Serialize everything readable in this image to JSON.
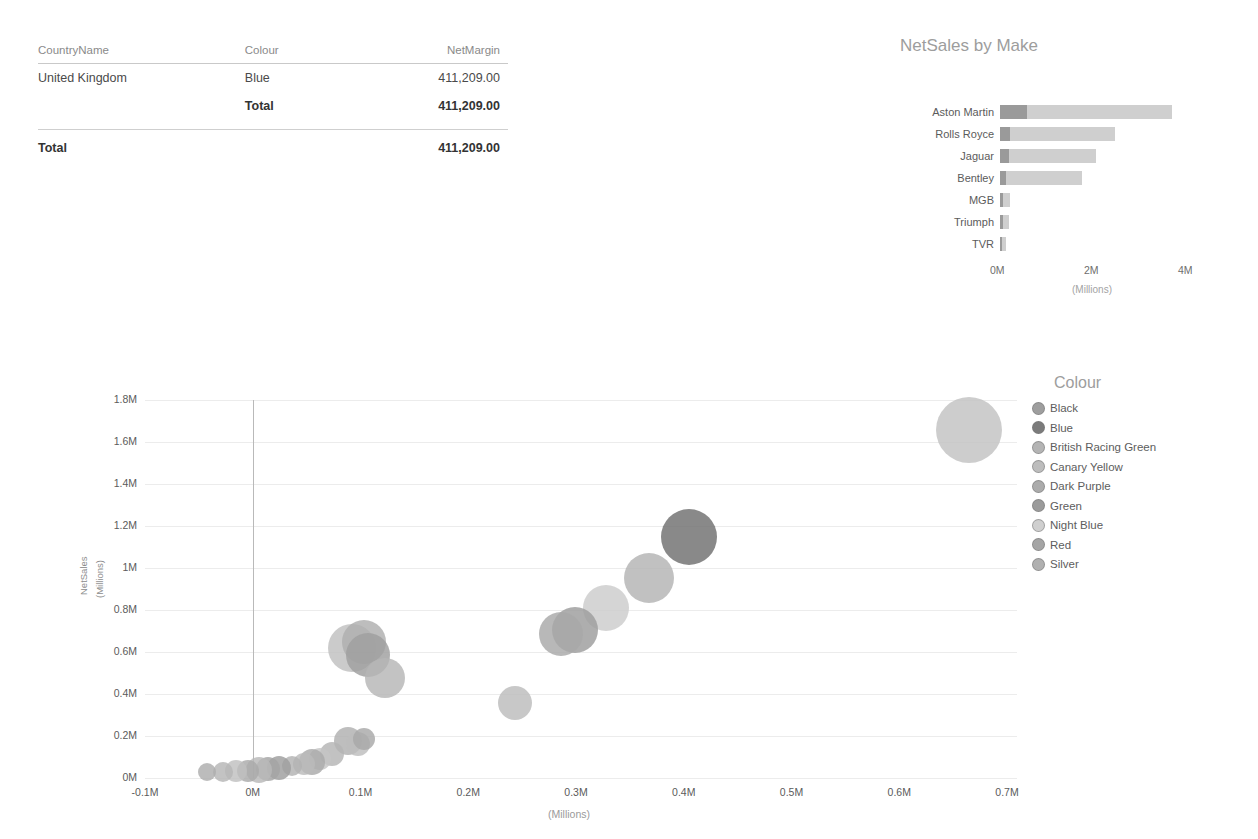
{
  "matrix": {
    "columns": [
      "CountryName",
      "Colour",
      "NetMargin"
    ],
    "rows": [
      {
        "country": "United Kingdom",
        "colour": "Blue",
        "netmargin": "411,209.00",
        "bold": false
      },
      {
        "country": "",
        "colour": "Total",
        "netmargin": "411,209.00",
        "bold": true
      }
    ],
    "grand_total_label": "Total",
    "grand_total_value": "411,209.00"
  },
  "bar_chart_title": "NetSales by Make",
  "scatter_legend_title": "Colour",
  "chart_data": [
    {
      "type": "bar",
      "title": "NetSales by Make",
      "orientation": "horizontal",
      "stacked": true,
      "xlabel": "(Millions)",
      "ylabel": "",
      "categories": [
        "Aston Martin",
        "Rolls Royce",
        "Jaguar",
        "Bentley",
        "MGB",
        "Triumph",
        "TVR"
      ],
      "values": [
        3.65,
        2.45,
        2.05,
        1.75,
        0.22,
        0.2,
        0.12
      ],
      "series": [
        {
          "name": "dark segment",
          "values": [
            0.58,
            0.22,
            0.2,
            0.13,
            0.07,
            0.06,
            0.05
          ],
          "color": "#9a9a9a"
        },
        {
          "name": "light segment",
          "values": [
            3.07,
            2.23,
            1.85,
            1.62,
            0.15,
            0.14,
            0.07
          ],
          "color": "#cfcfcf"
        }
      ],
      "xticks": [
        "0M",
        "2M",
        "4M"
      ],
      "xlim": [
        0,
        4
      ],
      "grid": false,
      "legend": "none"
    },
    {
      "type": "scatter",
      "subtype": "bubble",
      "title": "",
      "xlabel": "(Millions)",
      "ylabel": "NetSales (Millions)",
      "xticks": [
        "-0.1M",
        "0M",
        "0.1M",
        "0.2M",
        "0.3M",
        "0.4M",
        "0.5M",
        "0.6M",
        "0.7M"
      ],
      "yticks": [
        "0M",
        "0.2M",
        "0.4M",
        "0.6M",
        "0.8M",
        "1M",
        "1.2M",
        "1.4M",
        "1.6M",
        "1.8M"
      ],
      "xlim": [
        -0.1,
        0.7
      ],
      "ylim": [
        0,
        1.8
      ],
      "grid": true,
      "legend_position": "right",
      "legend_title": "Colour",
      "legend_entries": [
        {
          "label": "Black",
          "color": "#9e9e9e"
        },
        {
          "label": "Blue",
          "color": "#7b7b7b"
        },
        {
          "label": "British Racing Green",
          "color": "#b4b4b4"
        },
        {
          "label": "Canary Yellow",
          "color": "#bdbdbd"
        },
        {
          "label": "Dark Purple",
          "color": "#ababab"
        },
        {
          "label": "Green",
          "color": "#9b9b9b"
        },
        {
          "label": "Night Blue",
          "color": "#cfcfcf"
        },
        {
          "label": "Red",
          "color": "#a5a5a5"
        },
        {
          "label": "Silver",
          "color": "#b0b0b0"
        }
      ],
      "points": [
        {
          "x": 0.665,
          "y": 1.655,
          "r": 33,
          "color": "#c2c2c2"
        },
        {
          "x": 0.405,
          "y": 1.148,
          "r": 28,
          "color": "#6f6f6f"
        },
        {
          "x": 0.368,
          "y": 0.952,
          "r": 25,
          "color": "#b3b3b3"
        },
        {
          "x": 0.328,
          "y": 0.808,
          "r": 23,
          "color": "#cccccc"
        },
        {
          "x": 0.299,
          "y": 0.705,
          "r": 23,
          "color": "#9c9c9c"
        },
        {
          "x": 0.286,
          "y": 0.688,
          "r": 22,
          "color": "#a8a8a8"
        },
        {
          "x": 0.243,
          "y": 0.358,
          "r": 17,
          "color": "#bcbcbc"
        },
        {
          "x": 0.092,
          "y": 0.618,
          "r": 24,
          "color": "#c0c0c0"
        },
        {
          "x": 0.103,
          "y": 0.648,
          "r": 22,
          "color": "#aeaeae"
        },
        {
          "x": 0.107,
          "y": 0.588,
          "r": 22,
          "color": "#9f9f9f"
        },
        {
          "x": 0.123,
          "y": 0.478,
          "r": 20,
          "color": "#b6b6b6"
        },
        {
          "x": 0.088,
          "y": 0.175,
          "r": 14,
          "color": "#b0b0b0"
        },
        {
          "x": 0.098,
          "y": 0.162,
          "r": 12,
          "color": "#bdbdbd"
        },
        {
          "x": 0.103,
          "y": 0.188,
          "r": 11,
          "color": "#a8a8a8"
        },
        {
          "x": 0.074,
          "y": 0.112,
          "r": 12,
          "color": "#b4b4b4"
        },
        {
          "x": 0.062,
          "y": 0.092,
          "r": 11,
          "color": "#c4c4c4"
        },
        {
          "x": 0.055,
          "y": 0.078,
          "r": 13,
          "color": "#a9a9a9"
        },
        {
          "x": 0.048,
          "y": 0.065,
          "r": 11,
          "color": "#bbbbbb"
        },
        {
          "x": 0.036,
          "y": 0.055,
          "r": 10,
          "color": "#b2b2b2"
        },
        {
          "x": 0.024,
          "y": 0.048,
          "r": 12,
          "color": "#9d9d9d"
        },
        {
          "x": 0.014,
          "y": 0.042,
          "r": 12,
          "color": "#a4a4a4"
        },
        {
          "x": 0.006,
          "y": 0.038,
          "r": 13,
          "color": "#b8b8b8"
        },
        {
          "x": -0.004,
          "y": 0.035,
          "r": 11,
          "color": "#aaaaaa"
        },
        {
          "x": -0.016,
          "y": 0.032,
          "r": 11,
          "color": "#c0c0c0"
        },
        {
          "x": -0.028,
          "y": 0.03,
          "r": 10,
          "color": "#b6b6b6"
        },
        {
          "x": -0.042,
          "y": 0.028,
          "r": 9,
          "color": "#adadad"
        }
      ]
    }
  ]
}
